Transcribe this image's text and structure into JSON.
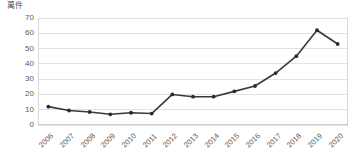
{
  "chart_data": {
    "type": "line",
    "title": "",
    "subtitle": "",
    "unit_label": "萬件",
    "xlabel": "",
    "ylabel": "",
    "categories": [
      "2006",
      "2007",
      "2008",
      "2009",
      "2010",
      "2011",
      "2012",
      "2013",
      "2014",
      "2015",
      "2016",
      "2017",
      "2018",
      "2019",
      "2020"
    ],
    "values": [
      12,
      9.5,
      8.5,
      7,
      8,
      7.5,
      20,
      18.5,
      18.5,
      22,
      25.5,
      34,
      45,
      62,
      53
    ],
    "series": [
      {
        "name": "件數",
        "values": [
          12,
          9.5,
          8.5,
          7,
          8,
          7.5,
          20,
          18.5,
          18.5,
          22,
          25.5,
          34,
          45,
          62,
          53
        ]
      }
    ],
    "yticks": [
      0,
      10,
      20,
      30,
      40,
      50,
      60,
      70
    ],
    "ylim": [
      0,
      70
    ],
    "grid": true,
    "legend": "none",
    "line_color": "#3a3a3a",
    "marker_color": "#2b2b2b",
    "grid_color": "#e2e2e2",
    "tick_color": "#5a5a5a",
    "x_tick_rotation": -45
  }
}
